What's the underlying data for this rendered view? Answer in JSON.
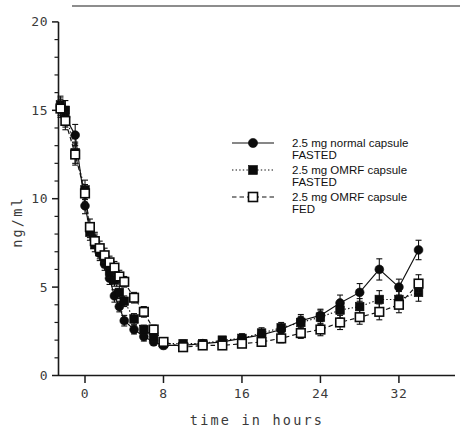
{
  "figure": {
    "title": "",
    "top_rule": true
  },
  "chart_data": {
    "type": "line",
    "title": "",
    "xlabel": "time in hours",
    "ylabel": "ng/ml",
    "xlim": [
      -2.8,
      36
    ],
    "ylim": [
      0,
      20
    ],
    "xticks": [
      0,
      8,
      16,
      24,
      32
    ],
    "xtick_labels": [
      "0",
      "8",
      "16",
      "24",
      "32"
    ],
    "yticks": [
      0,
      5,
      10,
      15,
      20
    ],
    "ytick_labels": [
      "0",
      "5",
      "10",
      "15",
      "20"
    ],
    "y_minor_ticks": [
      1,
      2,
      3,
      4,
      6,
      7,
      8,
      9,
      11,
      12,
      13,
      14,
      16,
      17,
      18,
      19
    ],
    "grid": false,
    "legend_position": "center-right",
    "error_bars": "SEM",
    "series": [
      {
        "name": "2.5 mg normal capsule FASTED",
        "label_line1": "2.5 mg normal capsule",
        "label_line2": "FASTED",
        "marker": "filled-circle",
        "linestyle": "solid",
        "color": "#0b0b0b",
        "x": [
          -2.5,
          -2.0,
          -1.0,
          0.0,
          0.5,
          1.0,
          1.5,
          2.0,
          2.5,
          3.0,
          3.5,
          4.0,
          5.0,
          6.0,
          7.0,
          8.0,
          10.0,
          12.0,
          14.0,
          16.0,
          18.0,
          20.0,
          22.0,
          24.0,
          26.0,
          28.0,
          30.0,
          32.0,
          34.0
        ],
        "y": [
          15.2,
          14.6,
          13.6,
          9.6,
          8.2,
          7.7,
          6.9,
          6.3,
          5.5,
          4.5,
          3.9,
          3.1,
          2.6,
          2.2,
          1.9,
          1.7,
          1.7,
          1.8,
          1.9,
          2.1,
          2.3,
          2.6,
          3.1,
          3.4,
          4.1,
          4.7,
          6.0,
          5.0,
          7.1
        ],
        "yerr": [
          0.5,
          0.55,
          0.6,
          0.45,
          0.4,
          0.4,
          0.4,
          0.35,
          0.35,
          0.35,
          0.3,
          0.3,
          0.25,
          0.25,
          0.2,
          0.2,
          0.2,
          0.2,
          0.2,
          0.25,
          0.25,
          0.3,
          0.35,
          0.35,
          0.45,
          0.5,
          0.6,
          0.45,
          0.55
        ]
      },
      {
        "name": "2.5 mg OMRF capsule FASTED",
        "label_line1": "2.5 mg OMRF capsule",
        "label_line2": "FASTED",
        "marker": "filled-square",
        "linestyle": "dotted",
        "color": "#0b0b0b",
        "x": [
          -2.5,
          -2.0,
          -1.0,
          0.0,
          0.5,
          1.0,
          1.5,
          2.0,
          2.5,
          3.0,
          3.5,
          4.0,
          5.0,
          6.0,
          7.0,
          8.0,
          10.0,
          12.0,
          14.0,
          16.0,
          18.0,
          20.0,
          22.0,
          24.0,
          26.0,
          28.0,
          30.0,
          32.0,
          34.0
        ],
        "y": [
          15.3,
          15.0,
          12.6,
          10.5,
          8.1,
          7.4,
          7.0,
          6.5,
          5.9,
          5.4,
          4.7,
          4.2,
          3.2,
          2.6,
          2.2,
          1.8,
          1.8,
          1.8,
          2.0,
          2.1,
          2.4,
          2.7,
          3.0,
          3.3,
          3.7,
          3.9,
          4.3,
          4.3,
          4.7
        ],
        "yerr": [
          0.5,
          0.55,
          0.6,
          0.55,
          0.45,
          0.4,
          0.4,
          0.4,
          0.35,
          0.35,
          0.35,
          0.3,
          0.3,
          0.25,
          0.25,
          0.2,
          0.2,
          0.2,
          0.2,
          0.25,
          0.3,
          0.3,
          0.35,
          0.4,
          0.45,
          0.45,
          0.5,
          0.45,
          0.5
        ]
      },
      {
        "name": "2.5 mg OMRF capsule FED",
        "label_line1": "2.5 mg OMRF capsule",
        "label_line2": "FED",
        "marker": "open-square",
        "linestyle": "dashed",
        "color": "#0b0b0b",
        "x": [
          -2.5,
          -2.0,
          -1.0,
          0.0,
          0.5,
          1.0,
          1.5,
          2.0,
          2.5,
          3.0,
          3.5,
          4.0,
          5.0,
          6.0,
          7.0,
          8.0,
          10.0,
          12.0,
          14.0,
          16.0,
          18.0,
          20.0,
          22.0,
          24.0,
          26.0,
          28.0,
          30.0,
          32.0,
          34.0
        ],
        "y": [
          15.1,
          14.4,
          12.5,
          10.3,
          8.4,
          7.6,
          7.2,
          6.8,
          6.4,
          6.1,
          5.6,
          5.3,
          4.4,
          3.6,
          2.6,
          1.9,
          1.6,
          1.7,
          1.7,
          1.8,
          1.9,
          2.1,
          2.4,
          2.6,
          3.0,
          3.3,
          3.6,
          4.0,
          5.2
        ],
        "yerr": [
          0.5,
          0.5,
          0.6,
          0.5,
          0.45,
          0.4,
          0.4,
          0.4,
          0.35,
          0.35,
          0.35,
          0.3,
          0.3,
          0.3,
          0.25,
          0.2,
          0.2,
          0.2,
          0.2,
          0.2,
          0.25,
          0.25,
          0.3,
          0.35,
          0.4,
          0.4,
          0.45,
          0.45,
          0.5
        ]
      }
    ]
  }
}
